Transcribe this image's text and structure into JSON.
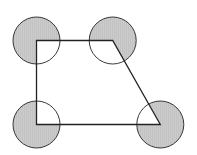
{
  "diagram": {
    "type": "geometry",
    "colors": {
      "background": "#ffffff",
      "stroke": "#222222",
      "shade": "#c9c9c9"
    },
    "radius": 23.5,
    "trapezoid": {
      "vertices": [
        {
          "name": "top-left",
          "x": 36.5,
          "y": 40.5
        },
        {
          "name": "top-right",
          "x": 112.7,
          "y": 40.5
        },
        {
          "name": "bottom-right",
          "x": 160.3,
          "y": 124.5
        },
        {
          "name": "bottom-left",
          "x": 36.5,
          "y": 124.5
        }
      ]
    },
    "circles": [
      {
        "name": "circle-top-left",
        "cx": 36.5,
        "cy": 40.5
      },
      {
        "name": "circle-top-right",
        "cx": 112.7,
        "cy": 40.5
      },
      {
        "name": "circle-bottom-right",
        "cx": 160.3,
        "cy": 124.5
      },
      {
        "name": "circle-bottom-left",
        "cx": 36.5,
        "cy": 124.5
      }
    ]
  }
}
